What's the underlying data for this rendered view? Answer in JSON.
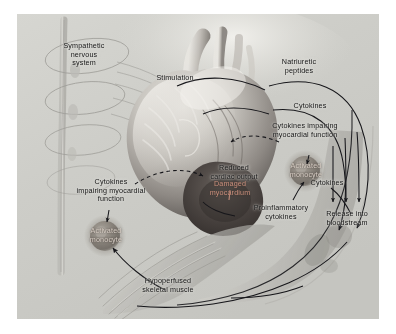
{
  "figure": {
    "kind": "medical-illustration",
    "background_color": "#ffffff",
    "plate_color": "#cfcfcb",
    "ink_color": "#151515"
  },
  "labels": {
    "sympathetic_nervous_system": "Sympathetic\nnervous\nsystem",
    "stimulation": "Stimulation",
    "natriuretic_peptides": "Natriuretic\npeptides",
    "cytokines_top_right": "Cytokines",
    "cytokines_impairing_right": "Cytokines impairing\nmyocardial function",
    "reduced_cardiac_output": "Reduced\ncardiac output",
    "damaged_myocardium": "Damaged\nmyocardium",
    "activated_monocyte_center": "Activated\nmonocyte",
    "cytokines_impairing_left": "Cytokines\nimpairing myocardial\nfunction",
    "activated_monocyte_left": "Activated\nmonocyte",
    "proinflammatory_cytokines": "Proinflammatory\ncytokines",
    "cytokines_right": "Cytokines",
    "release_into_bloodstream": "Release into\nbloodstream",
    "hypoperfused_skeletal_muscle": "Hypoperfused\nskeletal muscle"
  },
  "anatomy": {
    "heart": "heart-anatomical-cutaway",
    "spinal_cord": "spinal-cord-with-sympathetic-nerves",
    "skeletal_muscle": "skeletal-muscle-fibers",
    "limb_vessel": "limb-with-blood-vessel",
    "monocyte_center": "activated-monocyte-cell",
    "monocyte_left": "activated-monocyte-cell"
  },
  "connectors": {
    "natriuretic_peptides_arc": "solid-curved-arrow",
    "cytokines_arc": "solid-curved-arrow",
    "cytokines_impairing_dashed": "dashed-curved-arrow",
    "reduced_cardiac_output_dashed": "dashed-curved-arrow",
    "release_arrows": "three-short-down-arrows",
    "hypoperfusion_arrow": "solid-curved-arrow"
  }
}
